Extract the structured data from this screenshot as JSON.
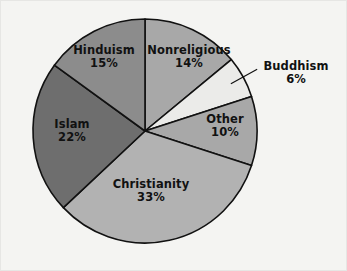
{
  "chart_data": {
    "type": "pie",
    "title": "",
    "subtitle": "",
    "xlabel": "",
    "ylabel": "",
    "legend_position": "none",
    "grid": false,
    "unit": "%",
    "categories": [
      "Nonreligious",
      "Buddhism",
      "Other",
      "Christianity",
      "Islam",
      "Hinduism"
    ],
    "values": [
      14,
      6,
      10,
      33,
      22,
      15
    ],
    "labels": [
      "14%",
      "6%",
      "10%",
      "33%",
      "22%",
      "15%"
    ],
    "start_angle_deg": 0,
    "direction": "clockwise",
    "slices": [
      {
        "name": "Nonreligious",
        "value": 14,
        "value_label": "14%",
        "color": "#a8a8a8",
        "label_placement": "inside"
      },
      {
        "name": "Buddhism",
        "value": 6,
        "value_label": "6%",
        "color": "#ebebe9",
        "label_placement": "outside"
      },
      {
        "name": "Other",
        "value": 10,
        "value_label": "10%",
        "color": "#a8a8a8",
        "label_placement": "inside"
      },
      {
        "name": "Christianity",
        "value": 33,
        "value_label": "33%",
        "color": "#b2b2b2",
        "label_placement": "inside"
      },
      {
        "name": "Islam",
        "value": 22,
        "value_label": "22%",
        "color": "#6e6e6e",
        "label_placement": "inside"
      },
      {
        "name": "Hinduism",
        "value": 15,
        "value_label": "15%",
        "color": "#8c8c8c",
        "label_placement": "inside"
      }
    ]
  },
  "style": {
    "background": "#f4f4f2",
    "outline": "#111111",
    "text": "#111111",
    "border": "#e6e6e4"
  },
  "geometry": {
    "center_x": 145,
    "center_y": 131,
    "radius": 112
  }
}
